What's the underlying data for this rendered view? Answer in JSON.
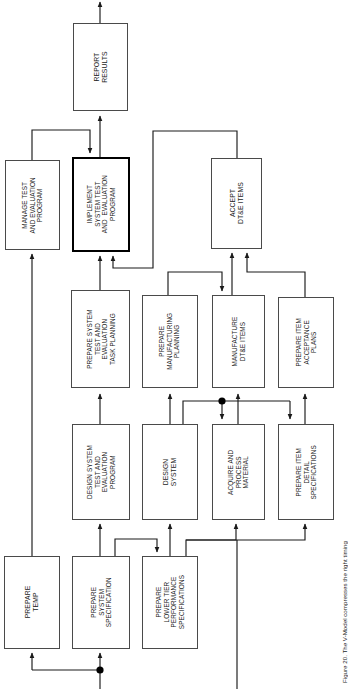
{
  "figure": {
    "caption": "Figure 20. The V-Model compresses the right timing",
    "type": "process-flow-diagram",
    "orientation": "rotated-90-ccw",
    "background_color": "#ffffff",
    "line_color": "#1a1a1a",
    "box_border_color": "#4a4a4a",
    "highlight_border_color": "#000000"
  },
  "nodes": [
    {
      "id": "report_results",
      "label": "REPORT\nRESULTS",
      "highlight": false,
      "x": 73,
      "y": 23,
      "w": 55,
      "h": 88,
      "size": "f7"
    },
    {
      "id": "manage_te_program",
      "label": "MANAGE TEST\nAND EVALUATION\nPROGRAM",
      "highlight": false,
      "x": 5,
      "y": 160,
      "w": 55,
      "h": 90,
      "size": "f65"
    },
    {
      "id": "implement_te_program",
      "label": "IMPLEMENT\nSYSTEM TEST\nAND  EVALUATION\nPROGRAM",
      "highlight": true,
      "x": 72,
      "y": 157,
      "w": 58,
      "h": 95,
      "size": "f65"
    },
    {
      "id": "accept_dte_items",
      "label": "ACCEPT\nDT&E ITEMS",
      "highlight": false,
      "x": 211,
      "y": 158,
      "w": 51,
      "h": 91,
      "size": "f7"
    },
    {
      "id": "prepare_te_task_plan",
      "label": "PREPARE SYSTEM\nTEST AND\nEVALUATION\nTASK PLANNING",
      "highlight": false,
      "x": 71,
      "y": 290,
      "w": 59,
      "h": 98,
      "size": "f65"
    },
    {
      "id": "prepare_mfg_planning",
      "label": "PREPARE\nMANUFACTURING\nPLANNING",
      "highlight": false,
      "x": 142,
      "y": 295,
      "w": 56,
      "h": 93,
      "size": "f65"
    },
    {
      "id": "manufacture_dte_items",
      "label": "MANUFACTURE\nDT&E ITEMS",
      "highlight": false,
      "x": 212,
      "y": 295,
      "w": 53,
      "h": 93,
      "size": "f65"
    },
    {
      "id": "prepare_item_accept",
      "label": "PREPARE ITEM\nACCEPTANCE\nPLANS",
      "highlight": false,
      "x": 278,
      "y": 297,
      "w": 56,
      "h": 91,
      "size": "f65"
    },
    {
      "id": "design_te_program",
      "label": "DESIGN SYSTEM\nTEST AND\nEVALUATION\nPROGRAM",
      "highlight": false,
      "x": 72,
      "y": 424,
      "w": 58,
      "h": 96,
      "size": "f65"
    },
    {
      "id": "design_system",
      "label": "DESIGN\nSYSTEM",
      "highlight": false,
      "x": 142,
      "y": 424,
      "w": 56,
      "h": 96,
      "size": "f7"
    },
    {
      "id": "acquire_process_mat",
      "label": "ACQUIRE AND\nPROCESS\nMATERIAL",
      "highlight": false,
      "x": 212,
      "y": 424,
      "w": 53,
      "h": 96,
      "size": "f65"
    },
    {
      "id": "prepare_item_detail",
      "label": "PREPARE ITEM\nDETAIL\nSPECIFICATIONS",
      "highlight": false,
      "x": 278,
      "y": 424,
      "w": 56,
      "h": 96,
      "size": "f65"
    },
    {
      "id": "prepare_temp",
      "label": "PREPARE\nTEMP",
      "highlight": false,
      "x": 4,
      "y": 556,
      "w": 56,
      "h": 93,
      "size": "f7"
    },
    {
      "id": "prepare_sys_spec",
      "label": "PREPARE\nSYSTEM\nSPECIFICATION",
      "highlight": false,
      "x": 72,
      "y": 556,
      "w": 58,
      "h": 93,
      "size": "f65"
    },
    {
      "id": "prepare_lower_tier",
      "label": "PREPARE\nLOWER TIER\nPERFORMANCE\nSPECIFICATIONS",
      "highlight": false,
      "x": 142,
      "y": 556,
      "w": 56,
      "h": 93,
      "size": "f65"
    }
  ],
  "junction_dots": [
    {
      "id": "dot-material-split",
      "x": 222,
      "y": 401,
      "r": 3.6
    },
    {
      "id": "dot-temp-split",
      "x": 100,
      "y": 670,
      "r": 3.6
    }
  ],
  "connectors": [
    {
      "id": "report-out-top",
      "from": "report_results",
      "to": "outside-top"
    },
    {
      "id": "implement-to-report",
      "from": "implement_te_program",
      "to": "report_results"
    },
    {
      "id": "manage-to-implement",
      "from": "manage_te_program",
      "to": "implement_te_program"
    },
    {
      "id": "accept-to-implement",
      "from": "accept_dte_items",
      "to": "implement_te_program"
    },
    {
      "id": "taskplan-to-implement",
      "from": "prepare_te_task_plan",
      "to": "implement_te_program"
    },
    {
      "id": "manufacture-to-accept",
      "from": "manufacture_dte_items",
      "to": "accept_dte_items"
    },
    {
      "id": "itemaccept-to-accept",
      "from": "prepare_item_accept",
      "to": "accept_dte_items"
    },
    {
      "id": "mfgplan-to-manufacture",
      "from": "prepare_mfg_planning",
      "to": "manufacture_dte_items"
    },
    {
      "id": "designte-to-taskplan",
      "from": "design_te_program",
      "to": "prepare_te_task_plan"
    },
    {
      "id": "designsys-to-mfgplan",
      "from": "design_system",
      "to": "prepare_mfg_planning"
    },
    {
      "id": "acquire-to-manufacture",
      "from": "acquire_process_mat",
      "to": "manufacture_dte_items"
    },
    {
      "id": "itemdetail-to-itemaccept",
      "from": "prepare_item_detail",
      "to": "prepare_item_accept"
    },
    {
      "id": "designsys-to-acquire",
      "from": "design_system",
      "to": "acquire_process_mat"
    },
    {
      "id": "designsys-to-itemdetail",
      "from": "design_system",
      "to": "prepare_item_detail"
    },
    {
      "id": "sysspec-to-designte",
      "from": "prepare_sys_spec",
      "to": "design_te_program"
    },
    {
      "id": "sysspec-to-designsys",
      "from": "prepare_sys_spec",
      "to": "design_system"
    },
    {
      "id": "sysspec-to-lowertier",
      "from": "prepare_sys_spec",
      "to": "prepare_lower_tier"
    },
    {
      "id": "lowertier-to-acquire",
      "from": "prepare_lower_tier",
      "to": "acquire_process_mat"
    },
    {
      "id": "lowertier-to-itemdetail",
      "from": "prepare_lower_tier",
      "to": "prepare_item_detail"
    },
    {
      "id": "temp-to-manage",
      "from": "prepare_temp",
      "to": "manage_te_program"
    },
    {
      "id": "bottom-feed-temp",
      "from": "outside-bottom",
      "to": "prepare_temp"
    },
    {
      "id": "bottom-feed-sysspec",
      "from": "outside-bottom",
      "to": "prepare_sys_spec"
    },
    {
      "id": "bottom-feed-right",
      "from": "outside-bottom",
      "to": "prepare_item_detail"
    }
  ]
}
